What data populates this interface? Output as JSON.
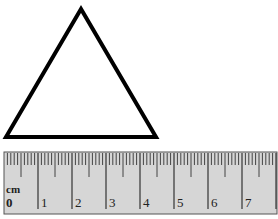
{
  "triangle": {
    "apex": [
      81,
      9
    ],
    "left": [
      6,
      137
    ],
    "right": [
      156,
      137
    ],
    "stroke": "#000000",
    "stroke_width": 4
  },
  "ruler": {
    "unit_label": "cm",
    "x0": 4,
    "px_per_cm": 34.0,
    "top": 152,
    "bottom": 214,
    "right": 277,
    "fill": "#d6d6d6",
    "border": "#555555",
    "numbers": [
      "0",
      "1",
      "2",
      "3",
      "4",
      "5",
      "6",
      "7"
    ]
  }
}
